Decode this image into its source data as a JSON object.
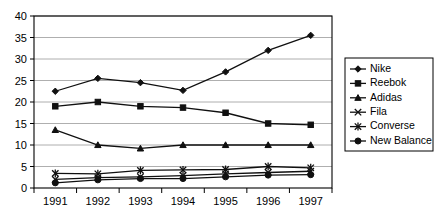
{
  "chart_data": {
    "type": "line",
    "title": "",
    "xlabel": "",
    "ylabel": "",
    "x": [
      "1991",
      "1992",
      "1993",
      "1994",
      "1995",
      "1996",
      "1997"
    ],
    "categories": [
      "1991",
      "1992",
      "1993",
      "1994",
      "1995",
      "1996",
      "1997"
    ],
    "ylim": [
      0,
      40
    ],
    "yticks": [
      0,
      5,
      10,
      15,
      20,
      25,
      30,
      35,
      40
    ],
    "ytick_labels": [
      "0",
      "5",
      "10",
      "15",
      "20",
      "25",
      "30",
      "35",
      "40"
    ],
    "grid": true,
    "grid_axis": "y",
    "legend_position": "right",
    "series": [
      {
        "name": "Nike",
        "marker": "diamond",
        "values": [
          22.5,
          25.5,
          24.5,
          22.7,
          27.0,
          32.0,
          35.5
        ]
      },
      {
        "name": "Reebok",
        "marker": "square",
        "values": [
          19.0,
          20.0,
          19.0,
          18.7,
          17.5,
          15.0,
          14.7
        ]
      },
      {
        "name": "Adidas",
        "marker": "triangle",
        "values": [
          13.5,
          10.0,
          9.2,
          10.0,
          10.0,
          10.0,
          10.0
        ]
      },
      {
        "name": "Fila",
        "marker": "x",
        "values": [
          2.0,
          2.4,
          2.6,
          2.9,
          3.3,
          3.6,
          3.9
        ]
      },
      {
        "name": "Converse",
        "marker": "star",
        "values": [
          3.4,
          3.3,
          4.1,
          4.2,
          4.3,
          5.0,
          4.7
        ]
      },
      {
        "name": "New Balance",
        "marker": "circle",
        "values": [
          1.2,
          1.9,
          2.2,
          2.2,
          2.6,
          3.0,
          3.1
        ]
      }
    ]
  },
  "legend": {
    "entries": [
      {
        "label": "Nike"
      },
      {
        "label": "Reebok"
      },
      {
        "label": "Adidas"
      },
      {
        "label": "Fila"
      },
      {
        "label": "Converse"
      },
      {
        "label": "New Balance"
      }
    ]
  },
  "colors": {
    "series": "#101010",
    "grid": "#9a9a9a",
    "frame": "#000000",
    "background": "#ffffff"
  }
}
